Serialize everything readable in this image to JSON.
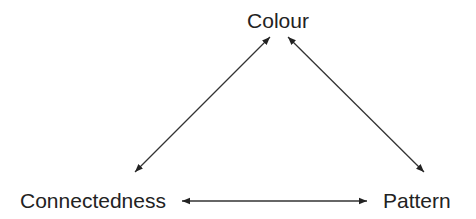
{
  "diagram": {
    "type": "triangle-relationship",
    "nodes": [
      {
        "id": "colour",
        "label": "Colour"
      },
      {
        "id": "connectedness",
        "label": "Connectedness"
      },
      {
        "id": "pattern",
        "label": "Pattern"
      }
    ],
    "edges": [
      {
        "from": "colour",
        "to": "connectedness",
        "direction": "bidirectional"
      },
      {
        "from": "colour",
        "to": "pattern",
        "direction": "bidirectional"
      },
      {
        "from": "connectedness",
        "to": "pattern",
        "direction": "bidirectional"
      }
    ],
    "colors": {
      "line": "#333333",
      "text": "#222222",
      "background": "#ffffff"
    }
  }
}
